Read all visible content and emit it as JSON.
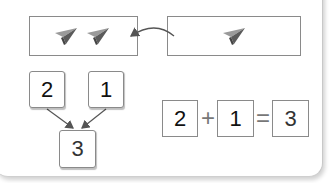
{
  "top_row": {
    "left_box": {
      "icons": [
        "paper-plane-icon",
        "paper-plane-icon"
      ],
      "count": 2
    },
    "right_box": {
      "icons": [
        "paper-plane-icon"
      ],
      "count": 1
    },
    "arrow": "curved-arrow-right-to-left"
  },
  "number_bond": {
    "part_a": "2",
    "part_b": "1",
    "whole": "3"
  },
  "equation": {
    "term_a": "2",
    "operator": "+",
    "term_b": "1",
    "equals": "=",
    "result": "3"
  },
  "colors": {
    "border": "#8a8a8a",
    "plane_dark": "#5a5a5a",
    "plane_light": "#9a9a9a",
    "arrow": "#555555"
  }
}
